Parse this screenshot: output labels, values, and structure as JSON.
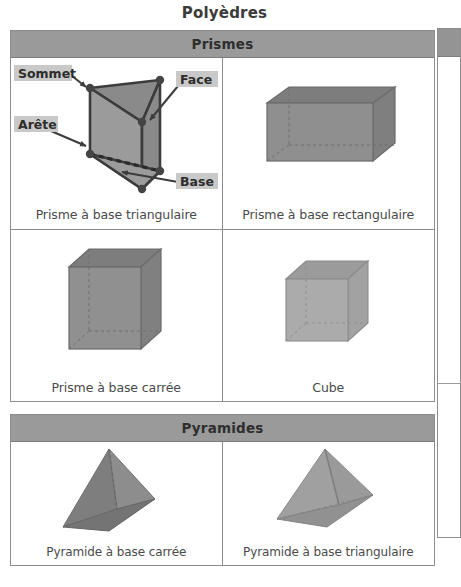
{
  "page": {
    "title": "Polyèdres"
  },
  "sections": [
    {
      "id": "prisms",
      "header": "Prismes",
      "cells": [
        {
          "caption": "Prisme à base triangulaire",
          "figure": "triangular-prism",
          "annotations": [
            {
              "label": "Sommet",
              "target": "vertex"
            },
            {
              "label": "Face",
              "target": "face"
            },
            {
              "label": "Arête",
              "target": "edge"
            },
            {
              "label": "Base",
              "target": "base"
            }
          ]
        },
        {
          "caption": "Prisme à base rectangulaire",
          "figure": "rectangular-prism",
          "annotations": []
        },
        {
          "caption": "Prisme à base carrée",
          "figure": "square-prism",
          "annotations": []
        },
        {
          "caption": "Cube",
          "figure": "cube",
          "annotations": []
        }
      ]
    },
    {
      "id": "pyramids",
      "header": "Pyramides",
      "cells": [
        {
          "caption": "Pyramide à base carrée",
          "figure": "square-pyramid",
          "annotations": []
        },
        {
          "caption": "Pyramide à base triangulaire",
          "figure": "triangular-pyramid",
          "annotations": []
        }
      ]
    }
  ],
  "colors": {
    "header_fill": "#9a9a9a",
    "border": "#8d8d8d",
    "label_box_fill": "#c9c9c9",
    "solid_front": "#8f8f8f",
    "solid_top": "#7b7b7b",
    "solid_light": "#ababab",
    "outline": "#3c3c3c",
    "caption_text": "#4a4a4a",
    "title_text": "#3b3b3b"
  }
}
